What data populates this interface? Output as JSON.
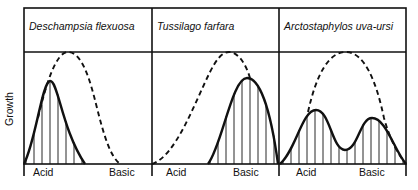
{
  "figure": {
    "ylabel": "Growth",
    "panels": [
      {
        "title": "Deschampsia flexuosa",
        "x_left_label": "Acid",
        "x_right_label": "Basic",
        "x0": 24,
        "x1": 152,
        "solid_path": "M24,164 C36,140 42,82 50,81 C58,80 62,130 85,164",
        "dashed_path": "M38,118 C46,84 56,52 68,52 C82,52 90,80 96,104 C104,136 110,156 120,164",
        "hatch_from": 26,
        "hatch_to": 84
      },
      {
        "title": "Tussilago farfara",
        "x_left_label": "Acid",
        "x_right_label": "Basic",
        "x0": 152,
        "x1": 279,
        "solid_path": "M208,164 C222,146 232,78 247,78 C262,78 272,120 278,164",
        "dashed_path": "M152,164 C176,156 194,104 210,72 C216,60 222,52 229,52 C238,52 246,64 250,78",
        "hatch_from": 210,
        "hatch_to": 277
      },
      {
        "title": "Arctostaphylos uva-ursi",
        "x_left_label": "Acid",
        "x_right_label": "Basic",
        "x0": 279,
        "x1": 406,
        "solid_path": "M280,164 C296,150 302,110 316,110 C330,110 332,150 345,150 C358,150 360,118 372,118 C386,118 394,150 406,164",
        "dashed_path": "M308,112 C316,76 328,52 346,52 C364,52 376,80 384,118 C390,140 398,154 406,164",
        "hatch_from": 283,
        "hatch_to": 404
      }
    ]
  }
}
